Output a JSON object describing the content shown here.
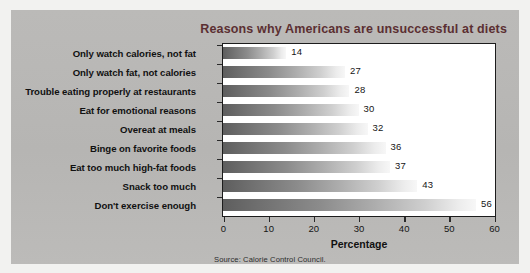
{
  "chart_data": {
    "type": "bar",
    "orientation": "horizontal",
    "title": "Reasons why Americans are unsuccessful at diets",
    "xlabel": "Percentage",
    "ylabel": "",
    "xlim": [
      0,
      60
    ],
    "xticks": [
      0,
      10,
      20,
      30,
      40,
      50,
      60
    ],
    "grid": false,
    "legend": null,
    "categories": [
      "Only watch calories, not fat",
      "Only watch fat, not calories",
      "Trouble eating properly at restaurants",
      "Eat for emotional reasons",
      "Overeat at meals",
      "Binge on favorite foods",
      "Eat too much high-fat foods",
      "Snack too much",
      "Don't exercise enough"
    ],
    "values": [
      14,
      27,
      28,
      30,
      32,
      36,
      37,
      43,
      56
    ],
    "value_labels": [
      "14",
      "27",
      "28",
      "30",
      "32",
      "36",
      "37",
      "43",
      "56"
    ],
    "source": "Source: Calorie Control Council.",
    "colors": {
      "panel_background": "#b9b8b6",
      "plot_background": "#ffffff",
      "plot_border": "#1c1c1c",
      "title_color": "#5b2f32",
      "bar_gradient_start": "#5e5e5e",
      "bar_gradient_end": "#f7f7f7",
      "text_color": "#111111"
    }
  }
}
